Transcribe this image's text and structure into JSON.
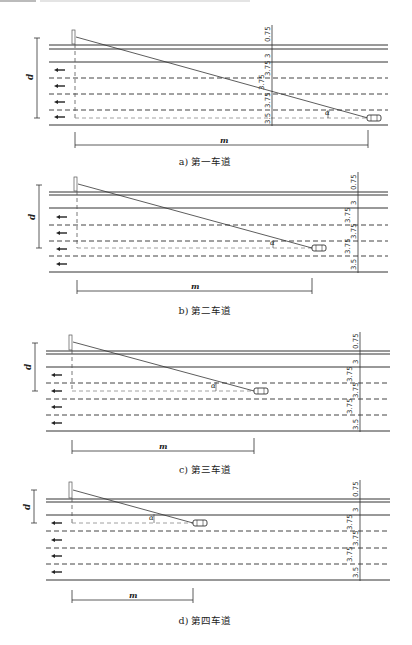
{
  "panels": [
    {
      "id": "a",
      "caption": "a) 第一车道",
      "d_label": "d",
      "m_label": "m",
      "angle_label": "α",
      "dims": [
        "0.75",
        "3",
        "3.75",
        "3.75",
        "3.75",
        "3.5"
      ],
      "car_lane": 1
    },
    {
      "id": "b",
      "caption": "b) 第二车道",
      "d_label": "d",
      "m_label": "m",
      "angle_label": "α",
      "dims": [
        "0.75",
        "3",
        "3.75",
        "3.75",
        "3.75",
        "3.5"
      ],
      "car_lane": 2
    },
    {
      "id": "c",
      "caption": "c) 第三车道",
      "d_label": "d",
      "m_label": "m",
      "angle_label": "α",
      "dims": [
        "0.75",
        "3",
        "3.75",
        "3.75",
        "3.75",
        "3.5"
      ],
      "car_lane": 3
    },
    {
      "id": "d",
      "caption": "d) 第四车道",
      "d_label": "d",
      "m_label": "m",
      "angle_label": "α",
      "dims": [
        "0.75",
        "3",
        "3.75",
        "3.75",
        "3.75",
        "3.5"
      ],
      "car_lane": 4
    }
  ],
  "icons": {
    "traffic_arrow": "left-arrow-icon",
    "vehicle": "car-icon",
    "sign": "sign-post-icon"
  },
  "colors": {
    "line": "#333333",
    "dashed": "#444444",
    "light_dashed": "#888888"
  }
}
